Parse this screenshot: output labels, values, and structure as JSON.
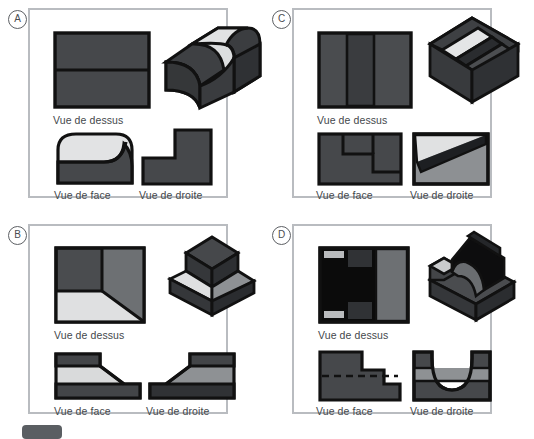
{
  "page": {
    "width": 534,
    "height": 433,
    "background": "#ffffff",
    "panel_border_color": "#b9bcc0",
    "text_color": "#44484c"
  },
  "palette": {
    "outline": "#111111",
    "dark": "#3f4144",
    "darker": "#2e3033",
    "black": "#0b0b0b",
    "mid": "#6d7073",
    "medium": "#5a5d60",
    "light": "#d8dadb",
    "lighter": "#e9eaea"
  },
  "view_labels": {
    "top": "Vue de dessus",
    "front": "Vue de face",
    "right": "Vue de droite"
  },
  "panels": [
    {
      "id": "A",
      "letter": "A",
      "solid": "filleted-step-block",
      "captions": {
        "top": "Vue de dessus",
        "front": "Vue de face",
        "right": "Vue de droite"
      }
    },
    {
      "id": "B",
      "letter": "B",
      "solid": "stepped-frustum",
      "captions": {
        "top": "Vue de dessus",
        "front": "Vue de face",
        "right": "Vue de droite"
      }
    },
    {
      "id": "C",
      "letter": "C",
      "solid": "angled-groove-block",
      "captions": {
        "top": "Vue de dessus",
        "front": "Vue de face",
        "right": "Vue de droite"
      }
    },
    {
      "id": "D",
      "letter": "D",
      "solid": "semicircular-channel-block",
      "captions": {
        "top": "Vue de dessus",
        "front": "Vue de face",
        "right": "Vue de droite"
      }
    }
  ],
  "footer": {
    "badge_label": "",
    "text": ""
  }
}
